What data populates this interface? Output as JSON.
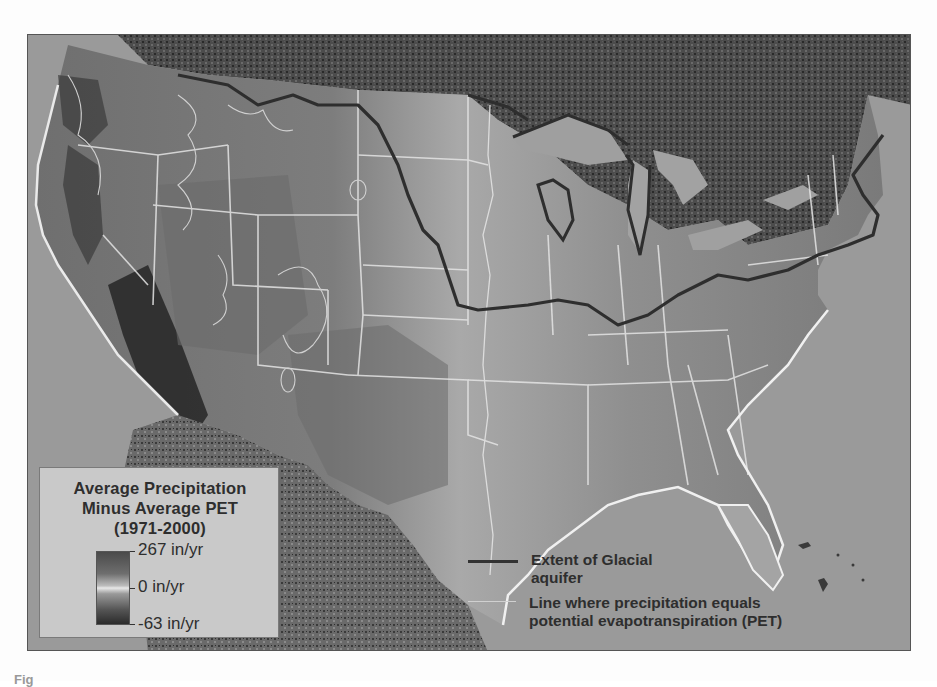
{
  "figure": {
    "type": "map",
    "caption_fragment": "Fig"
  },
  "legend": {
    "title_lines": [
      "Average Precipitation",
      "Minus Average PET",
      "(1971-2000)"
    ],
    "colorbar": {
      "max_label": "267 in/yr",
      "mid_label": "0 in/yr",
      "min_label": "-63 in/yr",
      "max_value": 267,
      "mid_value": 0,
      "min_value": -63,
      "unit": "in/yr"
    }
  },
  "line_legend": {
    "items": [
      {
        "style": "thick-dark",
        "color": "#333333",
        "label_lines": [
          "Extent of Glacial",
          "aquifer"
        ]
      },
      {
        "style": "thin-light",
        "color": "#d8d8d8",
        "label_lines": [
          "Line where precipitation equals",
          "potential evapotranspiration (PET)"
        ]
      }
    ]
  },
  "colors": {
    "ocean": "#9a9a9a",
    "canada": "#4d4d4d",
    "mexico": "#5a5a5a",
    "us_land": "#868686",
    "arid_southwest": "#2e2e2e",
    "humid_midwest": "#a8a8a8",
    "state_borders": "#e6e6e6",
    "glacial_extent": "#2f2f2f",
    "legend_bg": "#c9c9c9"
  }
}
